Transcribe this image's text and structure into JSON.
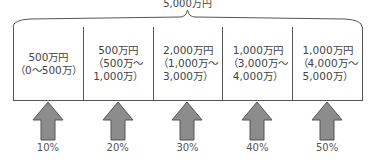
{
  "diagram": {
    "total_label": "5,000万円",
    "brackets": [
      {
        "amount": "500万円",
        "range_line1": "（0～500万）",
        "range_line2": ""
      },
      {
        "amount": "500万円",
        "range_line1": "（500万～",
        "range_line2": "1,000万）"
      },
      {
        "amount": "2,000万円",
        "range_line1": "（1,000万～",
        "range_line2": "3,000万）"
      },
      {
        "amount": "1,000万円",
        "range_line1": "（3,000万～",
        "range_line2": "4,000万）"
      },
      {
        "amount": "1,000万円",
        "range_line1": "（4,000万～",
        "range_line2": "5,000万）"
      }
    ],
    "rates": [
      "10%",
      "20%",
      "30%",
      "40%",
      "50%"
    ],
    "colors": {
      "arrow_fill": "#8c8c8c",
      "arrow_stroke": "#555555",
      "line": "#555555"
    }
  }
}
